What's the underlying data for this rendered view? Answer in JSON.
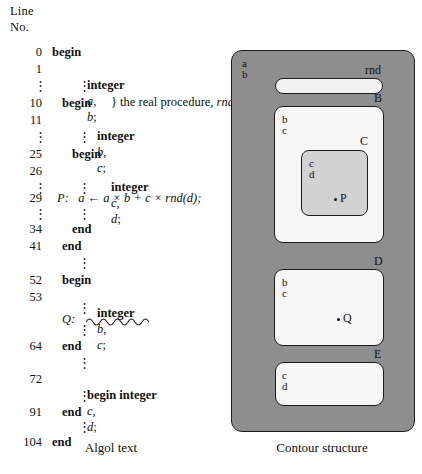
{
  "figure": {
    "caption_left": "Algol text",
    "caption_right": "Contour structure"
  },
  "listing": {
    "header_line1": "Line",
    "header_line2": "No.",
    "rows": [
      {
        "no": "0",
        "code": "begin",
        "indent": 0,
        "bold": true
      },
      {
        "no": "1",
        "code": "integer a, b;",
        "indent": 1,
        "bold": true
      },
      {
        "no": "",
        "code": "} the real procedure, rnd",
        "indent": 2,
        "bold": false
      },
      {
        "no": "10",
        "code": "begin",
        "indent": 1,
        "bold": true
      },
      {
        "no": "11",
        "code": "integer b, c;",
        "indent": 2,
        "bold": true
      },
      {
        "no": "25",
        "code": "begin",
        "indent": 2,
        "bold": true
      },
      {
        "no": "26",
        "code": "integer c, d;",
        "indent": 3,
        "bold": true
      },
      {
        "no": "29",
        "code": "P:   a ← a × b + c × rnd(d);",
        "indent": 0,
        "bold": false
      },
      {
        "no": "34",
        "code": "end",
        "indent": 2,
        "bold": true
      },
      {
        "no": "41",
        "code": "end",
        "indent": 1,
        "bold": true
      },
      {
        "no": "52",
        "code": "begin",
        "indent": 1,
        "bold": true
      },
      {
        "no": "53",
        "code": "integer b, c;",
        "indent": 2,
        "bold": true
      },
      {
        "no": "",
        "code": "Q:   ∿∿∿∿∿",
        "indent": 0,
        "bold": false
      },
      {
        "no": "64",
        "code": "end",
        "indent": 1,
        "bold": true
      },
      {
        "no": "72",
        "code": "begin integer c, d;",
        "indent": 1,
        "bold": true
      },
      {
        "no": "91",
        "code": "end",
        "indent": 1,
        "bold": true
      },
      {
        "no": "104",
        "code": "end",
        "indent": 0,
        "bold": true
      }
    ],
    "labels": {
      "line_0": "0",
      "line_1": "1",
      "line_10": "10",
      "line_11": "11",
      "line_25": "25",
      "line_26": "26",
      "line_29": "29",
      "line_34": "34",
      "line_41": "41",
      "line_52": "52",
      "line_53": "53",
      "line_64": "64",
      "line_72": "72",
      "line_91": "91",
      "line_104": "104"
    },
    "statements": {
      "decl_ab": "integer a, b;",
      "comment_rnd": "} the real procedure, rnd",
      "decl_bc_1": "integer b, c;",
      "decl_cd_1": "integer c, d;",
      "assign_P": "P:   a ← a × b + c × rnd(d);",
      "decl_bc_2": "integer b, c;",
      "stmt_Q": "Q:",
      "begin_integer_cd": "begin integer c, d;",
      "begin": "begin",
      "end": "end"
    }
  },
  "contour": {
    "outer": {
      "label": "",
      "vars": [
        "a",
        "b"
      ]
    },
    "rnd": {
      "label": "rnd"
    },
    "b_block": {
      "label": "B",
      "vars": [
        "b",
        "c"
      ]
    },
    "c_block": {
      "label": "C",
      "vars": [
        "c",
        "d"
      ],
      "point": "P"
    },
    "d_block": {
      "label": "D",
      "vars": [
        "b",
        "c"
      ],
      "point": "Q"
    },
    "e_block": {
      "label": "E",
      "vars": [
        "c",
        "d"
      ]
    },
    "colors": {
      "outer_fill": "#8e8e8e",
      "block_fill": "#f6f6f6",
      "c_fill": "#d2d2d2",
      "stroke": "#1d1d1d"
    }
  }
}
